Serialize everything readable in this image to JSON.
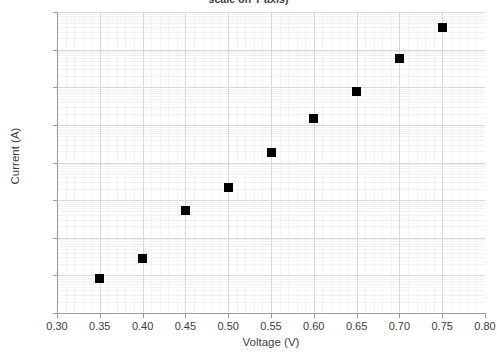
{
  "chart_data": {
    "type": "scatter",
    "title": "scale on Y axis)",
    "xlabel": "Voltage (V)",
    "ylabel": "Current (A)",
    "x": [
      0.35,
      0.4,
      0.45,
      0.5,
      0.55,
      0.6,
      0.65,
      0.7,
      0.75
    ],
    "values": [
      8.5e-07,
      2.8e-06,
      5.3e-05,
      0.00022,
      0.0018,
      0.015,
      0.078,
      0.58,
      3.8
    ],
    "series": [
      {
        "name": "Diode I-V",
        "points": [
          {
            "x": 0.35,
            "y": 8.5e-07
          },
          {
            "x": 0.4,
            "y": 2.8e-06
          },
          {
            "x": 0.45,
            "y": 5.3e-05
          },
          {
            "x": 0.5,
            "y": 0.00022
          },
          {
            "x": 0.55,
            "y": 0.0018
          },
          {
            "x": 0.6,
            "y": 0.015
          },
          {
            "x": 0.65,
            "y": 0.078
          },
          {
            "x": 0.7,
            "y": 0.58
          },
          {
            "x": 0.75,
            "y": 3.8
          }
        ]
      }
    ],
    "xlim": [
      0.3,
      0.8
    ],
    "ylim": [
      1e-07,
      10
    ],
    "yscale": "log",
    "xscale": "linear",
    "xticks": [
      "0.30",
      "0.35",
      "0.40",
      "0.45",
      "0.50",
      "0.55",
      "0.60",
      "0.65",
      "0.70",
      "0.75",
      "0.80"
    ],
    "xtick_values": [
      0.3,
      0.35,
      0.4,
      0.45,
      0.5,
      0.55,
      0.6,
      0.65,
      0.7,
      0.75,
      0.8
    ],
    "yticks": [
      "10",
      "10",
      "10",
      "10",
      "10",
      "10",
      "10",
      "10",
      "10"
    ],
    "ytick_exponents": [
      "1",
      "0",
      "-1",
      "-2",
      "-3",
      "-4",
      "-5",
      "-6",
      "-7"
    ],
    "ytick_values": [
      10,
      1,
      0.1,
      0.01,
      0.001,
      0.0001,
      1e-05,
      1e-06,
      1e-07
    ],
    "grid": true,
    "legend": null,
    "marker_color": "#000000",
    "marker_shape": "square",
    "grid_major_color": "#d8d8d8",
    "grid_minor_color": "#f2f2f2",
    "axis_color": "#9a9a9a",
    "text_color": "#3d3d3d"
  }
}
